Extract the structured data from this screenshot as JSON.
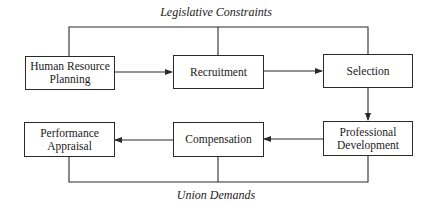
{
  "diagram": {
    "type": "flowchart",
    "top_constraint": "Legislative Constraints",
    "bottom_constraint": "Union Demands",
    "nodes": [
      {
        "id": "hrp",
        "label_line1": "Human Resource",
        "label_line2": "Planning"
      },
      {
        "id": "recruitment",
        "label_line1": "Recruitment",
        "label_line2": ""
      },
      {
        "id": "selection",
        "label_line1": "Selection",
        "label_line2": ""
      },
      {
        "id": "professional_development",
        "label_line1": "Professional",
        "label_line2": "Development"
      },
      {
        "id": "compensation",
        "label_line1": "Compensation",
        "label_line2": ""
      },
      {
        "id": "performance_appraisal",
        "label_line1": "Performance",
        "label_line2": "Appraisal"
      }
    ],
    "edges": [
      {
        "from": "hrp",
        "to": "recruitment"
      },
      {
        "from": "recruitment",
        "to": "selection"
      },
      {
        "from": "selection",
        "to": "professional_development"
      },
      {
        "from": "professional_development",
        "to": "compensation"
      },
      {
        "from": "compensation",
        "to": "performance_appraisal"
      }
    ],
    "line_color": "#2a2a2a"
  }
}
